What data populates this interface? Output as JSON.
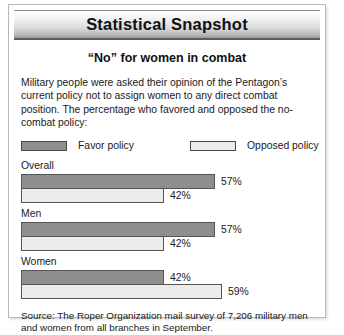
{
  "card": {
    "banner_title": "Statistical Snapshot",
    "subtitle": "“No” for women in combat",
    "intro": "Military people were asked their opinion of the Pentagon’s current policy not to assign women to any direct combat position. The percentage who favored and opposed the no-combat policy:",
    "source": "Source: The Roper Organization mail survey of 7,206 military men and women from all branches in September."
  },
  "legend": {
    "favor_label": "Favor policy",
    "opposed_label": "Opposed policy",
    "favor_color": "#8e8e8e",
    "opposed_color": "#ebebeb"
  },
  "groups": [
    {
      "label": "Overall",
      "favor_value": "57%",
      "opposed_value": "42%",
      "favor_width": "194px",
      "opposed_width": "143px"
    },
    {
      "label": "Men",
      "favor_value": "57%",
      "opposed_value": "42%",
      "favor_width": "194px",
      "opposed_width": "143px"
    },
    {
      "label": "Women",
      "favor_value": "42%",
      "opposed_value": "59%",
      "favor_width": "143px",
      "opposed_width": "201px"
    }
  ],
  "chart_data": {
    "type": "bar",
    "title": "“No” for women in combat",
    "subtitle": "Statistical Snapshot",
    "orientation": "horizontal",
    "categories": [
      "Overall",
      "Men",
      "Women"
    ],
    "series": [
      {
        "name": "Favor policy",
        "values": [
          57,
          57,
          42
        ],
        "color": "#8e8e8e"
      },
      {
        "name": "Opposed policy",
        "values": [
          42,
          42,
          59
        ],
        "color": "#ebebeb"
      }
    ],
    "value_suffix": "%",
    "xlabel": "",
    "ylabel": "",
    "xlim": [
      0,
      100
    ],
    "grid": false,
    "legend_position": "top",
    "data_labels": [
      {
        "category": "Overall",
        "Favor policy": "57%",
        "Opposed policy": "42%"
      },
      {
        "category": "Men",
        "Favor policy": "57%",
        "Opposed policy": "42%"
      },
      {
        "category": "Women",
        "Favor policy": "42%",
        "Opposed policy": "59%"
      }
    ],
    "annotations": [
      "Military people were asked their opinion of the Pentagon’s current policy not to assign women to any direct combat position. The percentage who favored and opposed the no-combat policy:",
      "Source: The Roper Organization mail survey of 7,206 military men and women from all branches in September."
    ]
  }
}
